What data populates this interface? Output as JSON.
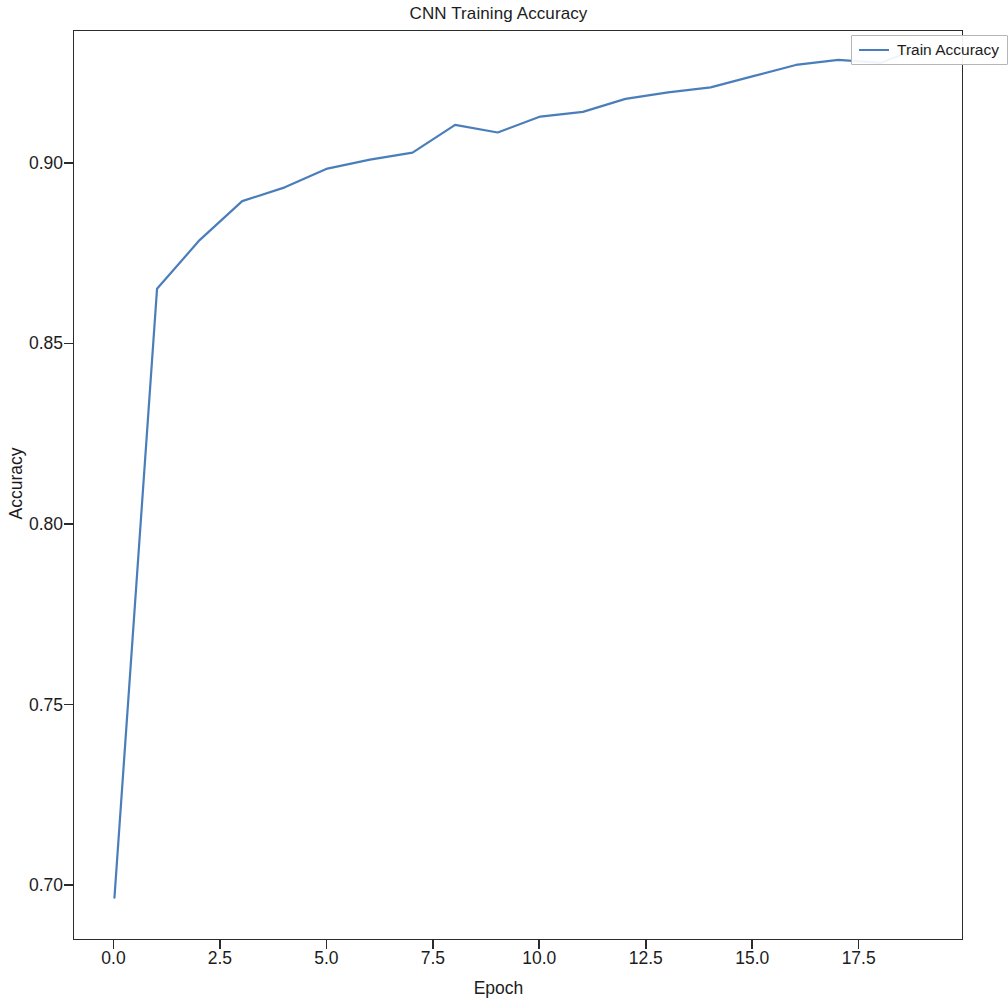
{
  "chart_data": {
    "type": "line",
    "title": "CNN Training Accuracy",
    "xlabel": "Epoch",
    "ylabel": "Accuracy",
    "xlim": [
      -0.95,
      19.95
    ],
    "ylim": [
      0.6848,
      0.9368
    ],
    "grid": false,
    "legend_position": "upper right",
    "line_color": "#4a7ebb",
    "background_color": "#ffffff",
    "axis_color": "#2b2b2b",
    "x_ticks": [
      0.0,
      2.5,
      5.0,
      7.5,
      10.0,
      12.5,
      15.0,
      17.5
    ],
    "x_tick_labels": [
      "0.0",
      "2.5",
      "5.0",
      "7.5",
      "10.0",
      "12.5",
      "15.0",
      "17.5"
    ],
    "y_ticks": [
      0.7,
      0.75,
      0.8,
      0.85,
      0.9
    ],
    "y_tick_labels": [
      "0.70",
      "0.75",
      "0.80",
      "0.85",
      "0.90"
    ],
    "series": [
      {
        "name": "Train Accuracy",
        "color": "#4a7ebb",
        "x": [
          0,
          1,
          2,
          3,
          4,
          5,
          6,
          7,
          8,
          9,
          10,
          11,
          12,
          13,
          14,
          15,
          16,
          17,
          18,
          19
        ],
        "values": [
          0.6968,
          0.8654,
          0.8789,
          0.8897,
          0.8935,
          0.8987,
          0.9012,
          0.9031,
          0.9108,
          0.9087,
          0.9131,
          0.9144,
          0.918,
          0.9198,
          0.9212,
          0.9243,
          0.9274,
          0.9288,
          0.928,
          0.9325
        ]
      }
    ]
  },
  "legend": {
    "entries": [
      {
        "label": "Train Accuracy"
      }
    ]
  }
}
